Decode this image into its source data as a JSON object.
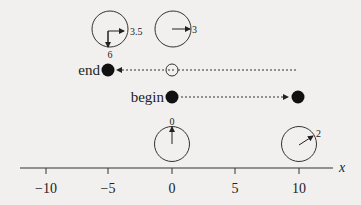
{
  "figure": {
    "axis": {
      "label": "x",
      "ticks": [
        {
          "value": -10,
          "label": "−10"
        },
        {
          "value": -5,
          "label": "−5"
        },
        {
          "value": 0,
          "label": "0"
        },
        {
          "value": 5,
          "label": "5"
        },
        {
          "value": 10,
          "label": "10"
        }
      ]
    },
    "markers": {
      "end_label": "end",
      "begin_label": "begin"
    },
    "dials": [
      {
        "id": "top-left",
        "label": "3.5",
        "label2": "6"
      },
      {
        "id": "top-right",
        "label": "3"
      },
      {
        "id": "bottom-left",
        "label": "0"
      },
      {
        "id": "bottom-right",
        "label": "2"
      }
    ]
  }
}
